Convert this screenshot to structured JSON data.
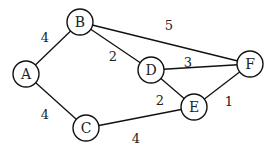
{
  "graph": {
    "nodes": [
      {
        "id": "A",
        "label": "A",
        "x": 26,
        "y": 74
      },
      {
        "id": "B",
        "label": "B",
        "x": 80,
        "y": 22
      },
      {
        "id": "C",
        "label": "C",
        "x": 86,
        "y": 128
      },
      {
        "id": "D",
        "label": "D",
        "x": 151,
        "y": 70
      },
      {
        "id": "E",
        "label": "E",
        "x": 194,
        "y": 107
      },
      {
        "id": "F",
        "label": "F",
        "x": 250,
        "y": 64
      }
    ],
    "edges": [
      {
        "from": "A",
        "to": "B",
        "weight": "4",
        "lx": 45,
        "ly": 38
      },
      {
        "from": "A",
        "to": "C",
        "weight": "4",
        "lx": 45,
        "ly": 115
      },
      {
        "from": "B",
        "to": "D",
        "weight": "2",
        "lx": 113,
        "ly": 57
      },
      {
        "from": "B",
        "to": "F",
        "weight": "5",
        "lx": 169,
        "ly": 26
      },
      {
        "from": "D",
        "to": "F",
        "weight": "3",
        "lx": 188,
        "ly": 63
      },
      {
        "from": "D",
        "to": "E",
        "weight": "2",
        "lx": 160,
        "ly": 101
      },
      {
        "from": "E",
        "to": "F",
        "weight": "1",
        "lx": 229,
        "ly": 102
      },
      {
        "from": "C",
        "to": "E",
        "weight": "4",
        "lx": 136,
        "ly": 139
      }
    ]
  }
}
